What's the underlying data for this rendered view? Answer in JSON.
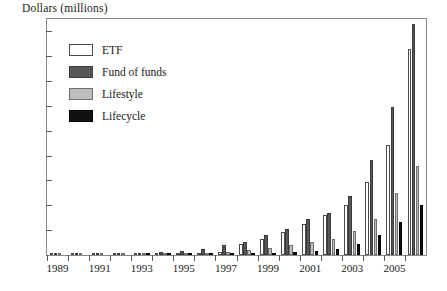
{
  "chart_data": {
    "type": "bar",
    "title": "",
    "ylabel": "Dollars (millions)",
    "xlabel": "",
    "ylim": [
      0,
      475
    ],
    "yticks": [
      50,
      100,
      150,
      200,
      250,
      300,
      350,
      400,
      450
    ],
    "grid": false,
    "legend_position": "top-left inside",
    "categories": [
      "1989",
      "1990",
      "1991",
      "1992",
      "1993",
      "1994",
      "1995",
      "1996",
      "1997",
      "1998",
      "1999",
      "2000",
      "2001",
      "2002",
      "2003",
      "2004",
      "2005",
      "2006"
    ],
    "xtick_labels": [
      "1989",
      "1991",
      "1993",
      "1995",
      "1997",
      "1999",
      "2001",
      "2003",
      "2005"
    ],
    "series": [
      {
        "name": "ETF",
        "color": "#ffffff",
        "values": [
          1,
          1,
          1,
          2,
          2,
          3,
          3,
          5,
          6,
          22,
          32,
          46,
          62,
          81,
          101,
          147,
          221,
          415
        ]
      },
      {
        "name": "Fund of funds",
        "color": "#585858",
        "values": [
          2,
          2,
          3,
          4,
          5,
          6,
          8,
          12,
          20,
          27,
          41,
          53,
          72,
          85,
          118,
          191,
          298,
          465
        ]
      },
      {
        "name": "Lifestyle",
        "color": "#bdbdbd",
        "values": [
          1,
          1,
          1,
          1,
          2,
          2,
          3,
          4,
          7,
          11,
          14,
          20,
          27,
          33,
          48,
          72,
          124,
          180
        ]
      },
      {
        "name": "Lifecycle",
        "color": "#111111",
        "values": [
          0,
          0,
          0,
          0,
          1,
          1,
          1,
          1,
          2,
          3,
          4,
          6,
          9,
          13,
          22,
          40,
          66,
          100
        ]
      }
    ]
  },
  "legend": {
    "items": [
      {
        "label": "ETF",
        "key": "etf"
      },
      {
        "label": "Fund of funds",
        "key": "fof"
      },
      {
        "label": "Lifestyle",
        "key": "lifestyle"
      },
      {
        "label": "Lifecycle",
        "key": "lifecycle"
      }
    ]
  }
}
